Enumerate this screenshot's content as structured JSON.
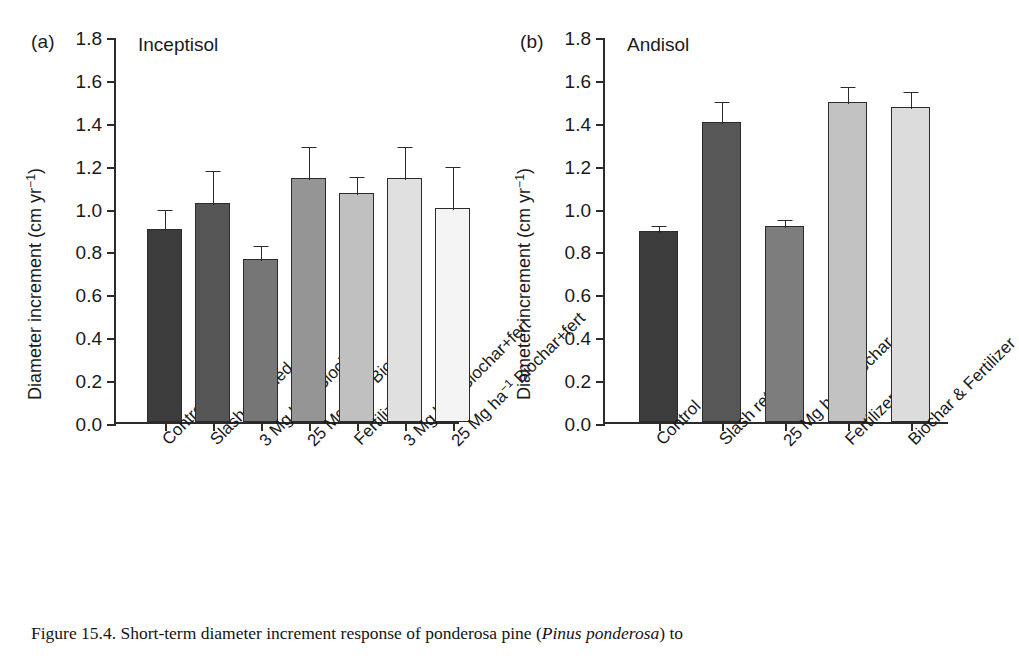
{
  "figure": {
    "caption_prefix": "Figure 15.4.",
    "caption_part1": " Short-term diameter increment response of ponderosa pine (",
    "caption_species": "Pinus ponderosa",
    "caption_part2": ") to"
  },
  "axis": {
    "ylabel_main": "Diameter increment (cm yr",
    "ylabel_exp": "−1",
    "ylabel_close": ")",
    "yticks": [
      "1.8",
      "1.6",
      "1.4",
      "1.2",
      "1.0",
      "0.8",
      "0.6",
      "0.4",
      "0.2",
      "0.0"
    ],
    "ymin": 0.0,
    "ymax": 1.8
  },
  "panels": {
    "a": {
      "letter": "(a)",
      "title": "Inceptisol"
    },
    "b": {
      "letter": "(b)",
      "title": "Andisol"
    }
  },
  "chart_data": [
    {
      "type": "bar",
      "panel": "(a)",
      "title": "Inceptisol",
      "xlabel": "",
      "ylabel": "Diameter increment (cm yr−1)",
      "ylim": [
        0.0,
        1.8
      ],
      "ytick_values": [
        0.0,
        0.2,
        0.4,
        0.6,
        0.8,
        1.0,
        1.2,
        1.4,
        1.6,
        1.8
      ],
      "grid": false,
      "legend": "none",
      "error_bars": "upper-only",
      "categories": [
        "Control",
        "Slash retained",
        "3 Mg ha−1 Biochar",
        "25 Mg ha−1 Biochar",
        "Fertilizer",
        "3 Mg ha−1 Biochar+fert",
        "25 Mg ha−1 Biochar+fert"
      ],
      "category_parts": [
        {
          "pre": "Control",
          "sup": "",
          "post": ""
        },
        {
          "pre": "Slash retained",
          "sup": "",
          "post": ""
        },
        {
          "pre": "3 Mg ha",
          "sup": "−1",
          "post": " Biochar"
        },
        {
          "pre": "25 Mg ha",
          "sup": "−1",
          "post": " Biochar"
        },
        {
          "pre": "Fertilizer",
          "sup": "",
          "post": ""
        },
        {
          "pre": "3 Mg ha",
          "sup": "−1",
          "post": " Biochar+fert"
        },
        {
          "pre": "25 Mg ha",
          "sup": "−1",
          "post": " Biochar+fert"
        }
      ],
      "values": [
        0.9,
        1.02,
        0.76,
        1.14,
        1.07,
        1.14,
        1.0
      ],
      "errors": [
        0.1,
        0.16,
        0.07,
        0.15,
        0.08,
        0.15,
        0.2
      ],
      "bar_colors": [
        "#3c3c3c",
        "#565656",
        "#767676",
        "#959595",
        "#c0c0c0",
        "#e0e0e0",
        "#f4f4f4"
      ]
    },
    {
      "type": "bar",
      "panel": "(b)",
      "title": "Andisol",
      "xlabel": "",
      "ylabel": "Diameter increment (cm yr−1)",
      "ylim": [
        0.0,
        1.8
      ],
      "ytick_values": [
        0.0,
        0.2,
        0.4,
        0.6,
        0.8,
        1.0,
        1.2,
        1.4,
        1.6,
        1.8
      ],
      "grid": false,
      "legend": "none",
      "error_bars": "upper-only",
      "categories": [
        "Control",
        "Slash retained",
        "25 Mg ha−1 Biochar",
        "Fertilizer",
        "Biochar & Fertilizer"
      ],
      "category_parts": [
        {
          "pre": "Control",
          "sup": "",
          "post": ""
        },
        {
          "pre": "Slash retained",
          "sup": "",
          "post": ""
        },
        {
          "pre": "25 Mg ha",
          "sup": "−1",
          "post": " Biochar"
        },
        {
          "pre": "Fertilizer",
          "sup": "",
          "post": ""
        },
        {
          "pre": "Biochar & Fertilizer",
          "sup": "",
          "post": ""
        }
      ],
      "values": [
        0.89,
        1.4,
        0.915,
        1.49,
        1.47
      ],
      "errors": [
        0.035,
        0.1,
        0.035,
        0.08,
        0.08
      ],
      "bar_colors": [
        "#3c3c3c",
        "#575757",
        "#7d7d7d",
        "#c2c2c2",
        "#dcdcdc"
      ]
    }
  ]
}
